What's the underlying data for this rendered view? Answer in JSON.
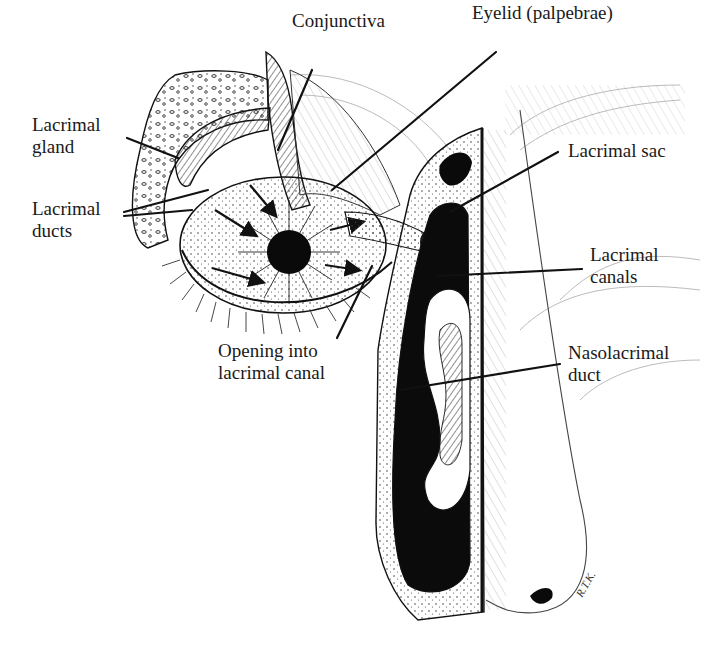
{
  "figure": {
    "signature": "R.T.K."
  },
  "labels": [
    {
      "id": "conjunctiva",
      "lines": [
        "Conjunctiva"
      ],
      "x": 292,
      "y": 10
    },
    {
      "id": "eyelid",
      "lines": [
        "Eyelid (palpebrae)"
      ],
      "x": 472,
      "y": 2
    },
    {
      "id": "lacrimal-gland",
      "lines": [
        "Lacrimal",
        "gland"
      ],
      "x": 32,
      "y": 114
    },
    {
      "id": "lacrimal-ducts",
      "lines": [
        "Lacrimal",
        "ducts"
      ],
      "x": 32,
      "y": 198
    },
    {
      "id": "lacrimal-sac",
      "lines": [
        "Lacrimal sac"
      ],
      "x": 568,
      "y": 140
    },
    {
      "id": "lacrimal-canals",
      "lines": [
        "Lacrimal",
        "canals"
      ],
      "x": 590,
      "y": 244
    },
    {
      "id": "opening-canal",
      "lines": [
        "Opening into",
        "lacrimal canal"
      ],
      "x": 218,
      "y": 340
    },
    {
      "id": "nasolacrimal-duct",
      "lines": [
        "Nasolacrimal",
        "duct"
      ],
      "x": 568,
      "y": 342
    }
  ],
  "leaders": [
    {
      "for": "conjunctiva",
      "x1": 312,
      "y1": 70,
      "x2": 278,
      "y2": 150
    },
    {
      "for": "eyelid",
      "x1": 496,
      "y1": 52,
      "x2": 332,
      "y2": 190
    },
    {
      "for": "lacrimal-gland",
      "x1": 127,
      "y1": 138,
      "x2": 178,
      "y2": 158
    },
    {
      "for": "lacrimal-ducts",
      "x1": 124,
      "y1": 212,
      "x2": 208,
      "y2": 190
    },
    {
      "for": "lacrimal-ducts",
      "x1": 124,
      "y1": 216,
      "x2": 192,
      "y2": 210
    },
    {
      "for": "lacrimal-sac",
      "x1": 558,
      "y1": 152,
      "x2": 450,
      "y2": 212
    },
    {
      "for": "lacrimal-canals",
      "x1": 582,
      "y1": 269,
      "x2": 438,
      "y2": 276
    },
    {
      "for": "opening-canal",
      "x1": 337,
      "y1": 338,
      "x2": 372,
      "y2": 266
    },
    {
      "for": "nasolacrimal-duct",
      "x1": 560,
      "y1": 364,
      "x2": 400,
      "y2": 390
    }
  ]
}
